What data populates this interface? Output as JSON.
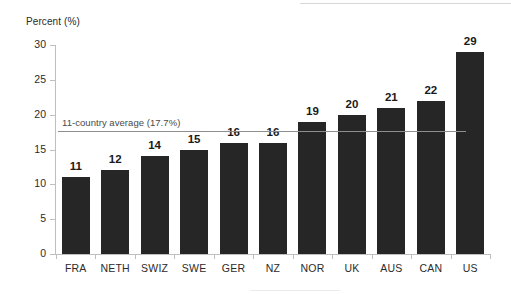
{
  "chart_data": {
    "type": "bar",
    "title": "",
    "xlabel": "",
    "ylabel": "Percent (%)",
    "categories": [
      "FRA",
      "NETH",
      "SWIZ",
      "SWE",
      "GER",
      "NZ",
      "NOR",
      "UK",
      "AUS",
      "CAN",
      "US"
    ],
    "values": [
      11,
      12,
      14,
      15,
      16,
      16,
      19,
      20,
      21,
      22,
      29
    ],
    "data_labels": [
      "11",
      "12",
      "14",
      "15",
      "16",
      "16",
      "19",
      "20",
      "21",
      "22",
      "29"
    ],
    "ylim": [
      0,
      30
    ],
    "y_ticks": [
      0,
      5,
      10,
      15,
      20,
      25,
      30
    ],
    "y_tick_labels": [
      "0",
      "5",
      "10",
      "15",
      "20",
      "25",
      "30"
    ],
    "grid": false,
    "legend": "none",
    "annotations": [
      {
        "name": "average-line",
        "label": "11-country average (17.7%)",
        "value": 17.7
      }
    ],
    "colors": {
      "bar": "#262626",
      "average_line": "#8e8e8e",
      "axis": "#bfbfbf",
      "text": "#2b2b2b",
      "background": "#ffffff"
    }
  }
}
